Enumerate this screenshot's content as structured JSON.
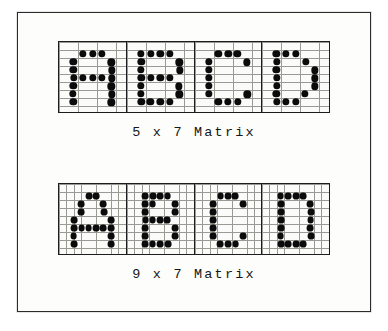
{
  "figure": {
    "background_color": "#ffffff",
    "paper_color": "#fdfdfb",
    "frame_color": "#2b2b2b",
    "grid_line_color": "#9a9a94",
    "cell_divider_color": "#1d1d1d",
    "dot_color": "#0b0b0b"
  },
  "panels": [
    {
      "name": "five-by-seven",
      "caption": "5 x 7 Matrix",
      "columns": 5,
      "rows": 7,
      "grid_cols": 7,
      "grid_rows": 9,
      "characters": [
        {
          "label": "A",
          "dots": [
            [
              1,
              0
            ],
            [
              2,
              0
            ],
            [
              3,
              0
            ],
            [
              0,
              1
            ],
            [
              4,
              1
            ],
            [
              0,
              2
            ],
            [
              4,
              2
            ],
            [
              0,
              3
            ],
            [
              1,
              3
            ],
            [
              2,
              3
            ],
            [
              3,
              3
            ],
            [
              4,
              3
            ],
            [
              0,
              4
            ],
            [
              4,
              4
            ],
            [
              0,
              5
            ],
            [
              4,
              5
            ],
            [
              0,
              6
            ],
            [
              4,
              6
            ]
          ]
        },
        {
          "label": "B",
          "dots": [
            [
              0,
              0
            ],
            [
              1,
              0
            ],
            [
              2,
              0
            ],
            [
              3,
              0
            ],
            [
              0,
              1
            ],
            [
              4,
              1
            ],
            [
              0,
              2
            ],
            [
              4,
              2
            ],
            [
              0,
              3
            ],
            [
              1,
              3
            ],
            [
              2,
              3
            ],
            [
              3,
              3
            ],
            [
              0,
              4
            ],
            [
              4,
              4
            ],
            [
              0,
              5
            ],
            [
              4,
              5
            ],
            [
              0,
              6
            ],
            [
              1,
              6
            ],
            [
              2,
              6
            ],
            [
              3,
              6
            ]
          ]
        },
        {
          "label": "C",
          "dots": [
            [
              1,
              0
            ],
            [
              2,
              0
            ],
            [
              3,
              0
            ],
            [
              0,
              1
            ],
            [
              4,
              1
            ],
            [
              0,
              2
            ],
            [
              0,
              3
            ],
            [
              0,
              4
            ],
            [
              0,
              5
            ],
            [
              4,
              5
            ],
            [
              1,
              6
            ],
            [
              2,
              6
            ],
            [
              3,
              6
            ]
          ]
        },
        {
          "label": "D",
          "dots": [
            [
              0,
              0
            ],
            [
              1,
              0
            ],
            [
              2,
              0
            ],
            [
              0,
              1
            ],
            [
              3,
              1
            ],
            [
              0,
              2
            ],
            [
              4,
              2
            ],
            [
              0,
              3
            ],
            [
              4,
              3
            ],
            [
              0,
              4
            ],
            [
              4,
              4
            ],
            [
              0,
              5
            ],
            [
              3,
              5
            ],
            [
              0,
              6
            ],
            [
              1,
              6
            ],
            [
              2,
              6
            ]
          ]
        }
      ]
    },
    {
      "name": "nine-by-seven",
      "caption": "9 x 7 Matrix",
      "columns": 9,
      "rows": 7,
      "grid_cols": 9,
      "grid_rows": 9,
      "characters": [
        {
          "label": "A",
          "dots": [
            [
              2,
              0
            ],
            [
              3,
              0
            ],
            [
              1,
              1
            ],
            [
              4,
              1
            ],
            [
              1,
              2
            ],
            [
              4,
              2
            ],
            [
              0,
              3
            ],
            [
              5,
              3
            ],
            [
              0,
              4
            ],
            [
              1,
              4
            ],
            [
              2,
              4
            ],
            [
              3,
              4
            ],
            [
              4,
              4
            ],
            [
              5,
              4
            ],
            [
              0,
              5
            ],
            [
              5,
              5
            ],
            [
              0,
              6
            ],
            [
              5,
              6
            ]
          ]
        },
        {
          "label": "B",
          "dots": [
            [
              0,
              0
            ],
            [
              1,
              0
            ],
            [
              2,
              0
            ],
            [
              3,
              0
            ],
            [
              0,
              1
            ],
            [
              1,
              1
            ],
            [
              4,
              1
            ],
            [
              0,
              2
            ],
            [
              4,
              2
            ],
            [
              0,
              3
            ],
            [
              1,
              3
            ],
            [
              2,
              3
            ],
            [
              3,
              3
            ],
            [
              0,
              4
            ],
            [
              4,
              4
            ],
            [
              0,
              5
            ],
            [
              4,
              5
            ],
            [
              0,
              6
            ],
            [
              1,
              6
            ],
            [
              2,
              6
            ],
            [
              3,
              6
            ]
          ]
        },
        {
          "label": "C",
          "dots": [
            [
              1,
              0
            ],
            [
              2,
              0
            ],
            [
              3,
              0
            ],
            [
              0,
              1
            ],
            [
              4,
              1
            ],
            [
              0,
              2
            ],
            [
              0,
              3
            ],
            [
              0,
              4
            ],
            [
              0,
              5
            ],
            [
              4,
              5
            ],
            [
              1,
              6
            ],
            [
              2,
              6
            ],
            [
              3,
              6
            ]
          ]
        },
        {
          "label": "D",
          "dots": [
            [
              0,
              0
            ],
            [
              1,
              0
            ],
            [
              2,
              0
            ],
            [
              3,
              0
            ],
            [
              0,
              1
            ],
            [
              4,
              1
            ],
            [
              0,
              2
            ],
            [
              4,
              2
            ],
            [
              0,
              3
            ],
            [
              4,
              3
            ],
            [
              0,
              4
            ],
            [
              4,
              4
            ],
            [
              0,
              5
            ],
            [
              4,
              5
            ],
            [
              0,
              6
            ],
            [
              1,
              6
            ],
            [
              2,
              6
            ],
            [
              3,
              6
            ]
          ]
        }
      ]
    }
  ]
}
